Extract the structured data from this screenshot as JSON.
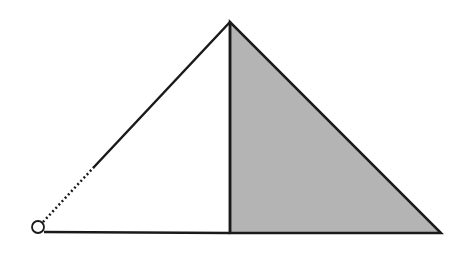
{
  "diagram": {
    "type": "geometric-figure",
    "colors": {
      "background": "#ffffff",
      "stroke": "#1a1a1a",
      "shaded_fill": "#b4b4b4"
    },
    "points": {
      "apex": [
        230,
        22
      ],
      "foot": [
        230,
        233
      ],
      "right_corner": [
        441,
        233
      ],
      "left_circle_center": [
        38,
        227
      ],
      "dotted_end": [
        94,
        167
      ]
    },
    "circle_radius": 6,
    "shaded_region": "right triangle (apex, foot, right_corner)"
  }
}
